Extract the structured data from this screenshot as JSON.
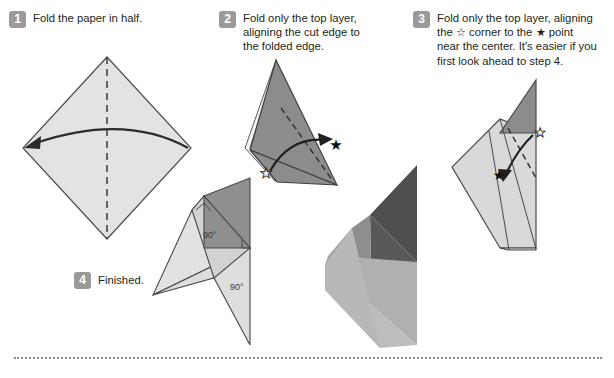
{
  "document": {
    "title": "Fold the paper in half. — origami instruction sheet",
    "background_color": "#ffffff",
    "text_color": "#231f20",
    "badge_color": "#9a9a9a",
    "badge_text_color": "#ffffff"
  },
  "steps": [
    {
      "number": "1",
      "text": "Fold the paper in half."
    },
    {
      "number": "2",
      "text": "Fold only the top layer,\naligning the cut edge to\nthe folded edge."
    },
    {
      "number": "3",
      "text": "Fold only the top layer, aligning\nthe ☆ corner to the ★ point\nnear the center. It's easier if you\nfirst look ahead to step 4."
    },
    {
      "number": "4",
      "text": "Finished."
    }
  ],
  "diagrams": {
    "step1": {
      "name": "square-diamond-with-vertical-valley-fold",
      "paper_fill": "#e3e3e3",
      "outline_color": "#4d4d4d",
      "fold_line_style": "dashed",
      "fold_line_color": "#3a3a3a",
      "arrow_color": "#2b2b2b",
      "arrow_direction": "right-to-left"
    },
    "step2": {
      "name": "dark-triangle-with-diagonal-valley-fold",
      "paper_fill": "#8c8c8c",
      "edge_highlight_fill": "#f2f2f2",
      "outline_color": "#3f3f3f",
      "fold_line_style": "dashed",
      "hollow_star_label": "☆",
      "filled_star_label": "★",
      "arrow_direction": "left-to-right"
    },
    "step3": {
      "name": "light-shape-with-dark-top-triangle",
      "paper_fill": "#d9d9d9",
      "flap_fill": "#8c8c8c",
      "outline_color": "#4a4a4a",
      "fold_line_style": "dashed",
      "hollow_star_label": "☆",
      "filled_star_label": "★",
      "arrow_direction": "top-right-to-center"
    },
    "step4": {
      "name": "finished-shape-with-right-angle-marks",
      "paper_fill": "#e0e0e0",
      "mid_fill": "#d2d2d2",
      "flap_fill": "#8f8f8f",
      "outline_color": "#4a4a4a",
      "angle_labels": [
        "90°",
        "90°"
      ]
    },
    "photo": {
      "name": "folded-paper-photo",
      "dark_fill": "#4f4f4f",
      "mid_fill": "#6f6f6f",
      "light_fill": "#a6a6a6",
      "lighter_fill": "#bcbcbc"
    }
  },
  "separator": {
    "name": "dotted-rule",
    "style": "dotted",
    "color": "#8d8d8d"
  }
}
